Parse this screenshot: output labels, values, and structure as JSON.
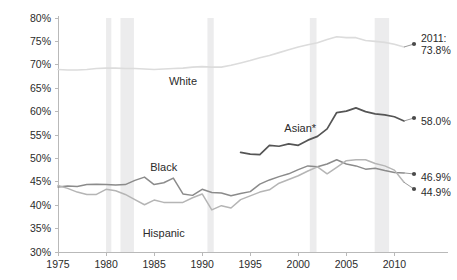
{
  "chart_data": {
    "type": "line",
    "title": "",
    "subtitle": "",
    "xlabel": "",
    "ylabel": "",
    "xlim": [
      1975,
      2011
    ],
    "ylim": [
      30,
      80
    ],
    "y_ticks": [
      "30%",
      "35%",
      "40%",
      "45%",
      "50%",
      "55%",
      "60%",
      "65%",
      "70%",
      "75%",
      "80%"
    ],
    "y_tick_values": [
      30,
      35,
      40,
      45,
      50,
      55,
      60,
      65,
      70,
      75,
      80
    ],
    "x_ticks": [
      "1975",
      "1980",
      "1985",
      "1990",
      "1995",
      "2000",
      "2005",
      "2010"
    ],
    "x_tick_values": [
      1975,
      1980,
      1985,
      1990,
      1995,
      2000,
      2005,
      2010
    ],
    "grid": false,
    "legend": "inline-labels",
    "legend_position": "inside-plot",
    "series": [
      {
        "name": "White",
        "label": "White",
        "color": "#dcdcdc",
        "width": 1.6,
        "label_x": 1988.0,
        "label_y": 65.6,
        "end_value": "73.8%",
        "end_year": "2011",
        "end_annotation": "2011:",
        "x": [
          1975,
          1976,
          1977,
          1978,
          1979,
          1980,
          1981,
          1982,
          1983,
          1984,
          1985,
          1986,
          1987,
          1988,
          1989,
          1990,
          1991,
          1992,
          1993,
          1994,
          1995,
          1996,
          1997,
          1998,
          1999,
          2000,
          2001,
          2002,
          2003,
          2004,
          2005,
          2006,
          2007,
          2008,
          2009,
          2010,
          2011
        ],
        "values": [
          69.0,
          68.9,
          68.9,
          69.0,
          69.2,
          69.3,
          69.3,
          69.2,
          69.2,
          69.1,
          69.0,
          69.1,
          69.2,
          69.3,
          69.5,
          69.6,
          69.5,
          69.5,
          69.9,
          70.4,
          70.9,
          71.5,
          72.0,
          72.6,
          73.2,
          73.8,
          74.3,
          74.7,
          75.4,
          76.0,
          75.8,
          75.8,
          75.2,
          75.0,
          74.8,
          74.4,
          73.8
        ]
      },
      {
        "name": "Asian",
        "label": "Asian*",
        "color": "#555555",
        "width": 1.7,
        "label_x": 2000.2,
        "label_y": 55.6,
        "end_value": "58.0%",
        "end_year": "",
        "end_annotation": "",
        "x": [
          1994,
          1995,
          1996,
          1997,
          1998,
          1999,
          2000,
          2001,
          2002,
          2003,
          2004,
          2005,
          2006,
          2007,
          2008,
          2009,
          2010,
          2011
        ],
        "values": [
          51.3,
          50.9,
          50.8,
          52.8,
          52.6,
          53.1,
          52.8,
          53.9,
          54.7,
          56.3,
          59.8,
          60.1,
          60.8,
          60.0,
          59.5,
          59.3,
          58.9,
          58.0
        ]
      },
      {
        "name": "Black",
        "label": "Black",
        "color": "#8b8b8b",
        "width": 1.5,
        "label_x": 1986.0,
        "label_y": 47.4,
        "end_value": "46.9%",
        "end_year": "",
        "end_annotation": "",
        "x": [
          1975,
          1976,
          1977,
          1978,
          1979,
          1980,
          1981,
          1982,
          1983,
          1984,
          1985,
          1986,
          1987,
          1988,
          1989,
          1990,
          1991,
          1992,
          1993,
          1994,
          1995,
          1996,
          1997,
          1998,
          1999,
          2000,
          2001,
          2002,
          2003,
          2004,
          2005,
          2006,
          2007,
          2008,
          2009,
          2010,
          2011
        ],
        "values": [
          43.9,
          44.1,
          44.0,
          44.4,
          44.5,
          44.4,
          44.3,
          44.4,
          45.3,
          46.0,
          44.4,
          44.8,
          45.8,
          42.4,
          42.1,
          43.4,
          42.7,
          42.6,
          42.0,
          42.5,
          42.9,
          44.5,
          45.4,
          46.1,
          46.7,
          47.6,
          48.4,
          48.2,
          48.8,
          49.7,
          48.8,
          48.4,
          47.7,
          47.9,
          47.4,
          47.0,
          46.9
        ]
      },
      {
        "name": "Hispanic",
        "label": "Hispanic",
        "color": "#b5b5b5",
        "width": 1.5,
        "label_x": 1986.0,
        "label_y": 33.2,
        "end_value": "44.9%",
        "end_year": "",
        "end_annotation": "",
        "x": [
          1975,
          1976,
          1977,
          1978,
          1979,
          1980,
          1981,
          1982,
          1983,
          1984,
          1985,
          1986,
          1987,
          1988,
          1989,
          1990,
          1991,
          1992,
          1993,
          1994,
          1995,
          1996,
          1997,
          1998,
          1999,
          2000,
          2001,
          2002,
          2003,
          2004,
          2005,
          2006,
          2007,
          2008,
          2009,
          2010,
          2011
        ],
        "values": [
          44.2,
          43.6,
          42.8,
          42.3,
          42.3,
          43.4,
          43.1,
          42.3,
          41.2,
          40.1,
          41.1,
          40.6,
          40.6,
          40.6,
          41.6,
          42.4,
          39.0,
          39.9,
          39.4,
          41.2,
          42.0,
          42.8,
          43.3,
          44.7,
          45.5,
          46.3,
          47.3,
          48.2,
          46.7,
          48.1,
          49.5,
          49.7,
          49.7,
          48.9,
          48.4,
          47.5,
          44.9
        ]
      }
    ],
    "recession_bands": [
      {
        "start": 1980.0,
        "end": 1980.55
      },
      {
        "start": 1981.5,
        "end": 1982.9
      },
      {
        "start": 1990.55,
        "end": 1991.2
      },
      {
        "start": 2001.2,
        "end": 2001.9
      },
      {
        "start": 2007.95,
        "end": 2009.45
      }
    ],
    "recession_color": "#ececed",
    "end_labels": [
      {
        "text": "2011:",
        "value": "73.8%",
        "series": "White"
      },
      {
        "text": "",
        "value": "58.0%",
        "series": "Asian"
      },
      {
        "text": "",
        "value": "46.9%",
        "series": "Black"
      },
      {
        "text": "",
        "value": "44.9%",
        "series": "Hispanic"
      }
    ]
  }
}
